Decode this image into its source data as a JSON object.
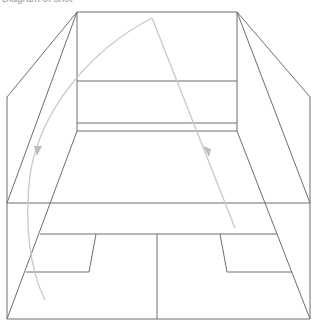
{
  "diagram": {
    "caption": "Diagram of shot",
    "court_line_color": "#6e6e6e",
    "trajectory_color": "#c8c8c8",
    "elements": {
      "front_wall": {
        "top_y": 12,
        "left_x": 77,
        "right_x": 237,
        "service_line_y": 81,
        "tin_top_y": 123,
        "tin_bottom_y": 131
      },
      "short_line_y": 234,
      "half_court_line_x": 157,
      "service_box_bottom_y": 272,
      "back_line_y": 319
    },
    "trajectories": [
      {
        "name": "straight-drive",
        "type": "straight",
        "from": [
          152,
          18
        ],
        "to": [
          235,
          228
        ]
      },
      {
        "name": "boast-curve",
        "type": "curved",
        "from": [
          152,
          18
        ],
        "to": [
          45,
          300
        ]
      }
    ]
  }
}
